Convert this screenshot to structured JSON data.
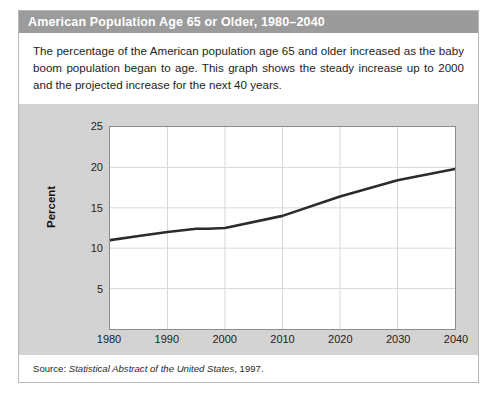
{
  "figure": {
    "title": "American Population Age 65 or Older, 1980–2040",
    "caption": "The percentage of the American population age 65 and older increased as the baby boom population began to age. This graph shows the steady increase up to 2000 and the projected increase for the next 40 years.",
    "source_label": "Source:",
    "source_title": "Statistical Abstract of the United States",
    "source_year": ", 1997."
  },
  "colors": {
    "title_bar": "#9b9b9b",
    "band": "#d3d3d3",
    "plot_bg": "#ffffff",
    "line": "#2b2b2b",
    "grid": "#d8d8d8",
    "frame": "#8d8d8d",
    "text": "#1d1d1d"
  },
  "chart_data": {
    "type": "line",
    "title": "American Population Age 65 or Older, 1980–2040",
    "xlabel": "",
    "ylabel": "Percent",
    "xlim": [
      1980,
      2040
    ],
    "ylim": [
      0,
      25
    ],
    "grid": true,
    "legend": "none",
    "x_ticks": [
      1980,
      1990,
      2000,
      2010,
      2020,
      2030,
      2040
    ],
    "y_ticks": [
      5,
      10,
      15,
      20,
      25
    ],
    "series": [
      {
        "name": "Percent of population age 65 or older",
        "x": [
          1980,
          1985,
          1990,
          1995,
          1997,
          2000,
          2010,
          2020,
          2030,
          2040
        ],
        "values": [
          11.0,
          11.5,
          12.0,
          12.4,
          12.4,
          12.5,
          14.0,
          16.4,
          18.4,
          19.8
        ]
      }
    ]
  }
}
